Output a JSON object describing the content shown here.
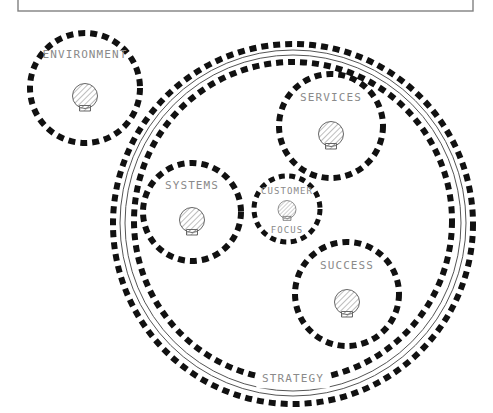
{
  "canvas": {
    "width": 493,
    "height": 413,
    "background": "#ffffff"
  },
  "frame": {
    "name": "slide-border",
    "stroke": "#808080",
    "x": 18,
    "y": -40,
    "width": 455,
    "height": 51
  },
  "style": {
    "dash_color": "#111111",
    "label_color": "#8a8a8a",
    "thin_line_color": "#555555",
    "icon_stroke": "#555555",
    "icon_fill": "#ffffff",
    "hatch_color": "#777777"
  },
  "rings": [
    {
      "name": "strategy-outer-dashed-ring",
      "cx": 293,
      "cy": 224,
      "r": 180,
      "style": "dashed",
      "stroke_width": 6,
      "dash": "7 5"
    },
    {
      "name": "strategy-thin-ring-outer",
      "cx": 293,
      "cy": 223,
      "r": 173,
      "style": "solid-thin",
      "stroke_width": 1,
      "dash": "none"
    },
    {
      "name": "strategy-thin-ring-inner",
      "cx": 293,
      "cy": 223,
      "r": 168,
      "style": "solid-thin",
      "stroke_width": 1,
      "dash": "none"
    },
    {
      "name": "strategy-inner-dashed-ring",
      "cx": 293,
      "cy": 221,
      "r": 159,
      "style": "dashed",
      "stroke_width": 6,
      "dash": "7 5"
    }
  ],
  "ring_label": {
    "name": "strategy-label",
    "text": "STRATEGY",
    "x": 293,
    "y": 379,
    "font_size": 11
  },
  "nodes": [
    {
      "id": "environment",
      "label": "ENVIRONMENT",
      "label_lines": [
        "ENVIRONMENT"
      ],
      "cx": 85,
      "cy": 88,
      "r": 55,
      "font_size": 11,
      "label_dy": -33,
      "icon_cy_offset": 10,
      "icon_scale": 1.0
    },
    {
      "id": "services",
      "label": "SERVICES",
      "label_lines": [
        "SERVICES"
      ],
      "cx": 331,
      "cy": 126,
      "r": 52,
      "font_size": 11,
      "label_dy": -28,
      "icon_cy_offset": 10,
      "icon_scale": 1.0
    },
    {
      "id": "systems",
      "label": "SYSTEMS",
      "label_lines": [
        "SYSTEMS"
      ],
      "cx": 192,
      "cy": 212,
      "r": 49,
      "font_size": 11,
      "label_dy": -26,
      "icon_cy_offset": 10,
      "icon_scale": 1.0
    },
    {
      "id": "customer-focus",
      "label": "CUSTOMER FOCUS",
      "label_lines": [
        "CUSTOMER",
        "FOCUS"
      ],
      "cx": 287,
      "cy": 209,
      "r": 33,
      "font_size": 9,
      "label_dy": -18,
      "label_dy2": 21,
      "icon_cy_offset": 2,
      "icon_scale": 0.72
    },
    {
      "id": "success",
      "label": "SUCCESS",
      "label_lines": [
        "SUCCESS"
      ],
      "cx": 347,
      "cy": 294,
      "r": 52,
      "font_size": 11,
      "label_dy": -28,
      "icon_cy_offset": 10,
      "icon_scale": 1.0
    }
  ],
  "icon": {
    "name": "hatched-bulb-icon",
    "description": "hatched circle with small rectangular base"
  }
}
